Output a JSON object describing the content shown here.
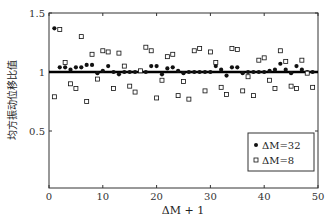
{
  "chart_data": {
    "type": "scatter",
    "title": "",
    "xlabel": "ΔM + 1",
    "ylabel": "均方振动位移比值",
    "xlim": [
      0,
      50
    ],
    "ylim": [
      0,
      1.5
    ],
    "xticks": [
      0,
      10,
      20,
      30,
      40,
      50
    ],
    "yticks": [
      0.5,
      1,
      1.5
    ],
    "ytick_labels": [
      "0.5",
      "1",
      "1.5"
    ],
    "xtick_labels": [
      "0",
      "10",
      "20",
      "30",
      "40",
      "50"
    ],
    "grid": false,
    "legend_position": "lower right",
    "reference_line": {
      "y": 1.0,
      "style": "thick solid black"
    },
    "series": [
      {
        "name": "ΔM=32",
        "marker": "filled-circle",
        "x": [
          1,
          2,
          3,
          4,
          5,
          6,
          7,
          8,
          9,
          10,
          11,
          12,
          13,
          14,
          15,
          16,
          17,
          18,
          19,
          20,
          21,
          22,
          23,
          24,
          25,
          26,
          27,
          28,
          29,
          30,
          31,
          32,
          33,
          34,
          35,
          36,
          37,
          38,
          39,
          40,
          41,
          42,
          43,
          44,
          45,
          46,
          47,
          48,
          49
        ],
        "values": [
          1.37,
          1.04,
          1.04,
          1.02,
          1.04,
          1.04,
          1.06,
          1.06,
          0.99,
          1.01,
          1.05,
          1.0,
          0.98,
          1.0,
          1.0,
          1.0,
          1.01,
          1.0,
          1.05,
          1.05,
          0.98,
          1.03,
          1.04,
          1.01,
          0.99,
          1.0,
          1.0,
          1.0,
          1.0,
          1.0,
          1.05,
          1.02,
          0.97,
          1.04,
          1.04,
          0.99,
          1.0,
          1.0,
          1.0,
          1.0,
          1.01,
          1.02,
          1.07,
          1.02,
          0.99,
          1.05,
          1.02,
          1.0,
          1.0
        ]
      },
      {
        "name": "ΔM=8",
        "marker": "open-square",
        "x": [
          1,
          2,
          3,
          4,
          5,
          6,
          7,
          8,
          9,
          10,
          11,
          12,
          13,
          14,
          15,
          16,
          17,
          18,
          19,
          20,
          21,
          22,
          23,
          24,
          25,
          26,
          27,
          28,
          29,
          30,
          31,
          32,
          33,
          34,
          35,
          36,
          37,
          38,
          39,
          40,
          41,
          42,
          43,
          44,
          45,
          46,
          47,
          48,
          49
        ],
        "values": [
          0.79,
          1.36,
          1.08,
          0.9,
          0.86,
          1.3,
          0.75,
          1.15,
          0.94,
          1.18,
          1.17,
          0.86,
          1.16,
          1.05,
          0.88,
          0.83,
          1.01,
          1.21,
          1.18,
          0.78,
          0.93,
          1.13,
          1.15,
          0.8,
          0.92,
          0.77,
          1.18,
          1.2,
          0.84,
          1.17,
          1.08,
          0.87,
          0.81,
          1.2,
          1.19,
          0.84,
          0.96,
          0.8,
          1.1,
          1.12,
          0.93,
          0.86,
          1.18,
          1.09,
          0.88,
          0.86,
          1.1,
          0.99,
          0.87
        ]
      }
    ]
  },
  "legend": {
    "items": [
      {
        "label": "ΔM=32",
        "marker": "filled-circle"
      },
      {
        "label": "ΔM=8",
        "marker": "open-square"
      }
    ]
  },
  "colors": {
    "axis": "#333333",
    "marker": "#111111",
    "background": "#ffffff"
  }
}
